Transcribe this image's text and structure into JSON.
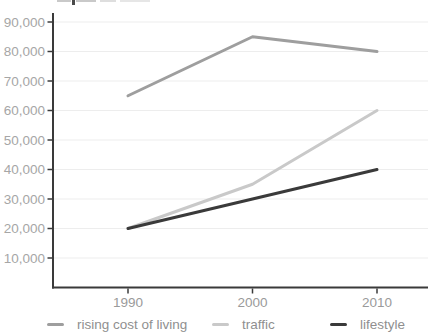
{
  "chart_data": {
    "type": "line",
    "x": [
      "1990",
      "2000",
      "2010"
    ],
    "series": [
      {
        "name": "rising cost of living",
        "values": [
          65000,
          85000,
          80000
        ],
        "color": "#9e9e9e"
      },
      {
        "name": "traffic",
        "values": [
          20000,
          35000,
          60000
        ],
        "color": "#c9c9c9"
      },
      {
        "name": "lifestyle",
        "values": [
          20000,
          30000,
          40000
        ],
        "color": "#3a3a3a"
      }
    ],
    "ytick_values": [
      10000,
      20000,
      30000,
      40000,
      50000,
      60000,
      70000,
      80000,
      90000
    ],
    "ytick_labels": [
      "10,000",
      "20,000",
      "30,000",
      "40,000",
      "50,000",
      "60,000",
      "70,000",
      "80,000",
      "90,000"
    ],
    "ylim": [
      0,
      90000
    ],
    "grid": true,
    "legend_position": "bottom",
    "title": ""
  },
  "colors": {
    "background": "#ffffff",
    "axis": "#3a3a3a",
    "grid": "#ededed",
    "y_tick_label": "#a6a6a6",
    "x_tick_label": "#9a9a9a",
    "legend_label": "#8f8f8f"
  }
}
